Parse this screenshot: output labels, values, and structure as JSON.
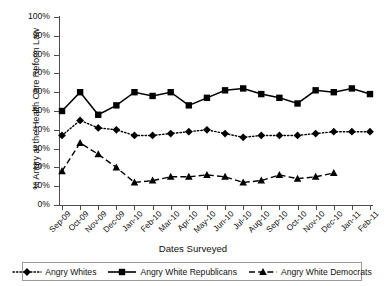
{
  "chart_data": {
    "type": "line",
    "title": "",
    "xlabel": "Dates Surveyed",
    "ylabel": "% Angry at the Health Care Reform Law",
    "ylim": [
      0,
      100
    ],
    "grid": false,
    "legend_position": "bottom",
    "ytick_labels": [
      "100%",
      "90%",
      "80%",
      "70%",
      "60%",
      "50%",
      "40%",
      "30%",
      "20%",
      "10%",
      "0%"
    ],
    "ytick_values": [
      100,
      90,
      80,
      70,
      60,
      50,
      40,
      30,
      20,
      10,
      0
    ],
    "categories": [
      "Sep-09",
      "Oct-09",
      "Nov-09",
      "Dec-09",
      "Jan-10",
      "Feb-10",
      "Mar-10",
      "Apr-10",
      "May-10",
      "Jun-10",
      "Jul-10",
      "Aug-10",
      "Sep-10",
      "Oct-10",
      "Nov-10",
      "Dec-10",
      "Jan-11",
      "Feb-11"
    ],
    "series": [
      {
        "name": "Angry Whites",
        "marker": "diamond",
        "linestyle": "dotted",
        "color": "#000000",
        "values": [
          37,
          45,
          41,
          40,
          37,
          37,
          38,
          39,
          40,
          38,
          36,
          37,
          37,
          37,
          38,
          39,
          39,
          39
        ]
      },
      {
        "name": "Angry White Republicans",
        "marker": "square",
        "linestyle": "solid",
        "color": "#000000",
        "values": [
          50,
          60,
          48,
          53,
          60,
          58,
          60,
          53,
          57,
          61,
          62,
          59,
          57,
          54,
          61,
          60,
          62,
          59
        ]
      },
      {
        "name": "Angry White Democrats",
        "marker": "triangle",
        "linestyle": "dashed",
        "color": "#000000",
        "values": [
          18,
          33,
          27,
          20,
          12,
          13,
          15,
          15,
          16,
          15,
          12,
          13,
          16,
          14,
          15,
          17,
          null,
          null
        ]
      }
    ]
  },
  "legend": {
    "items": [
      {
        "label": "Angry Whites"
      },
      {
        "label": "Angry White Republicans"
      },
      {
        "label": "Angry White Democrats"
      }
    ]
  }
}
